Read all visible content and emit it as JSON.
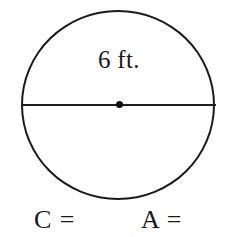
{
  "figure": {
    "type": "circle-diagram",
    "background_color": "#ffffff",
    "stroke_color": "#1b1b1b",
    "shape_name": "circle",
    "diameter_label": "6 ft.",
    "diameter_value": 6,
    "diameter_unit": "ft.",
    "center_point_label": "center-point",
    "has_diameter_line": true,
    "has_center_dot": true
  },
  "prompts": {
    "circumference": "C =",
    "area": "A ="
  },
  "chart_data": {
    "type": "diagram",
    "shape": "circle",
    "title": "",
    "labels": [
      "6 ft.",
      "C =",
      "A ="
    ],
    "measurements": [
      {
        "name": "diameter",
        "value": 6,
        "unit": "ft.",
        "label": "6 ft."
      }
    ],
    "unknowns": [
      {
        "symbol": "C",
        "name": "circumference",
        "prompt": "C =",
        "value": ""
      },
      {
        "symbol": "A",
        "name": "area",
        "prompt": "A =",
        "value": ""
      }
    ],
    "annotations": [
      "diameter line through center",
      "center point marked with dot"
    ]
  }
}
